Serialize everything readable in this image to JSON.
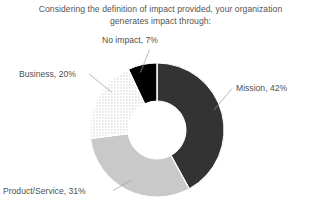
{
  "chart_data": {
    "type": "pie",
    "variant": "donut",
    "title": "Considering the definition of impact provided, your organization generates impact through:",
    "title_line1": "Considering the definition of impact provided, your organization",
    "title_line2": "generates impact through:",
    "categories": [
      "Mission",
      "Product/Service",
      "Business",
      "No impact"
    ],
    "values": [
      42,
      31,
      20,
      7
    ],
    "unit": "%",
    "labels": [
      "Mission, 42%",
      "Product/Service, 31%",
      "Business, 20%",
      "No impact, 7%"
    ],
    "colors": [
      "#333333",
      "#c9c9c9",
      "#ffffff",
      "#000000"
    ],
    "fill_styles": [
      "solid",
      "solid",
      "dotted-pattern",
      "solid"
    ],
    "start_angle_deg": 0,
    "direction": "clockwise",
    "legend": "none",
    "grid": false,
    "data_labels": "outside-with-leader-lines",
    "slices": [
      {
        "name": "Mission",
        "value": 42,
        "label": "Mission, 42%",
        "color": "#333333",
        "fill_style": "solid"
      },
      {
        "name": "Product/Service",
        "value": 31,
        "label": "Product/Service, 31%",
        "color": "#c9c9c9",
        "fill_style": "solid"
      },
      {
        "name": "Business",
        "value": 20,
        "label": "Business, 20%",
        "color": "#ffffff",
        "fill_style": "dotted-pattern"
      },
      {
        "name": "No impact",
        "value": 7,
        "label": "No impact, 7%",
        "color": "#000000",
        "fill_style": "solid"
      }
    ]
  }
}
